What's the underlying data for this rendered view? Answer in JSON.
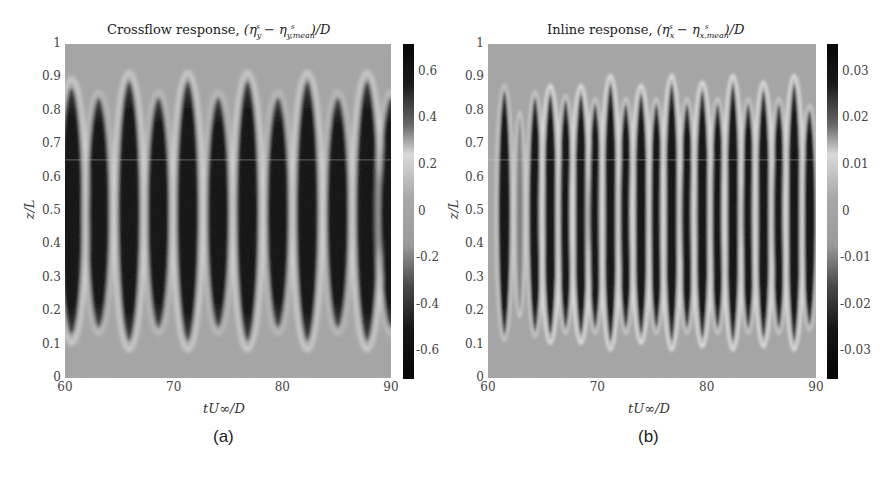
{
  "chart_data": [
    {
      "type": "heatmap",
      "panel": "(a)",
      "title": "Crossflow response, (η_y^s − η_{y,mean}^s)/D",
      "title_parts": {
        "text": "Crossflow response, ",
        "math": "(η",
        "sub1": "y",
        "sup1": "s",
        "minus": " − η",
        "sub2": "y,mean",
        "sup2": "s",
        "tail": ")/D"
      },
      "xlabel": "tU∞/D",
      "ylabel": "z/L",
      "xlim": [
        60,
        90
      ],
      "ylim": [
        0,
        1
      ],
      "xticks": [
        60,
        70,
        80,
        90
      ],
      "yticks": [
        0,
        0.1,
        0.2,
        0.3,
        0.4,
        0.5,
        0.6,
        0.7,
        0.8,
        0.9,
        1
      ],
      "colorbar": {
        "min": -0.72,
        "max": 0.72,
        "ticks": [
          0.6,
          0.4,
          0.2,
          0,
          -0.2,
          -0.4,
          -0.6
        ],
        "tick_labels": [
          "0.6",
          "0.4",
          "0.2",
          "0",
          "-0.2",
          "-0.4",
          "-0.6"
        ]
      },
      "colormap": "diverging gray (dark at extremes, light near +0.2)",
      "bands": [
        {
          "t": 60.6,
          "z_top": 0.87,
          "z_bottom": 0.13,
          "halo": true
        },
        {
          "t": 63.1,
          "z_top": 0.84,
          "z_bottom": 0.15,
          "halo": false
        },
        {
          "t": 65.9,
          "z_top": 0.89,
          "z_bottom": 0.11,
          "halo": true
        },
        {
          "t": 68.6,
          "z_top": 0.84,
          "z_bottom": 0.15,
          "halo": false
        },
        {
          "t": 71.3,
          "z_top": 0.89,
          "z_bottom": 0.11,
          "halo": true
        },
        {
          "t": 74.1,
          "z_top": 0.84,
          "z_bottom": 0.15,
          "halo": false
        },
        {
          "t": 76.8,
          "z_top": 0.89,
          "z_bottom": 0.11,
          "halo": true
        },
        {
          "t": 79.6,
          "z_top": 0.84,
          "z_bottom": 0.15,
          "halo": false
        },
        {
          "t": 82.3,
          "z_top": 0.89,
          "z_bottom": 0.11,
          "halo": true
        },
        {
          "t": 85.1,
          "z_top": 0.84,
          "z_bottom": 0.15,
          "halo": false
        },
        {
          "t": 87.8,
          "z_top": 0.89,
          "z_bottom": 0.11,
          "halo": true
        },
        {
          "t": 90.0,
          "z_top": 0.84,
          "z_bottom": 0.15,
          "halo": false
        }
      ],
      "band_half_width_t": 1.0
    },
    {
      "type": "heatmap",
      "panel": "(b)",
      "title": "Inline response, (η_x^s − η_{x,mean}^s)/D",
      "title_parts": {
        "text": "Inline response, ",
        "math": "(η",
        "sub1": "x",
        "sup1": "s",
        "minus": " − η",
        "sub2": "x,mean",
        "sup2": "s",
        "tail": ")/D"
      },
      "xlabel": "tU∞/D",
      "ylabel": "z/L",
      "xlim": [
        60,
        90
      ],
      "ylim": [
        0,
        1
      ],
      "xticks": [
        60,
        70,
        80,
        90
      ],
      "yticks": [
        0,
        0.1,
        0.2,
        0.3,
        0.4,
        0.5,
        0.6,
        0.7,
        0.8,
        0.9,
        1
      ],
      "colorbar": {
        "min": -0.036,
        "max": 0.036,
        "ticks": [
          0.03,
          0.02,
          0.01,
          0,
          -0.01,
          -0.02,
          -0.03
        ],
        "tick_labels": [
          "0.03",
          "0.02",
          "0.01",
          "0",
          "-0.01",
          "-0.02",
          "-0.03"
        ]
      },
      "colormap": "diverging gray (dark at extremes, light near +0.01)",
      "bands": [
        {
          "t": 61.5,
          "z_top": 0.86,
          "z_bottom": 0.13,
          "halo": false
        },
        {
          "t": 62.9,
          "z_top": 0.78,
          "z_bottom": 0.2,
          "halo": false,
          "weak": true
        },
        {
          "t": 64.3,
          "z_top": 0.84,
          "z_bottom": 0.14,
          "halo": false
        },
        {
          "t": 65.7,
          "z_top": 0.85,
          "z_bottom": 0.13,
          "halo": true
        },
        {
          "t": 67.1,
          "z_top": 0.83,
          "z_bottom": 0.15,
          "halo": false
        },
        {
          "t": 68.5,
          "z_top": 0.85,
          "z_bottom": 0.13,
          "halo": true
        },
        {
          "t": 69.8,
          "z_top": 0.82,
          "z_bottom": 0.15,
          "halo": false
        },
        {
          "t": 71.2,
          "z_top": 0.88,
          "z_bottom": 0.11,
          "halo": true
        },
        {
          "t": 72.6,
          "z_top": 0.82,
          "z_bottom": 0.15,
          "halo": false
        },
        {
          "t": 74.0,
          "z_top": 0.85,
          "z_bottom": 0.13,
          "halo": true
        },
        {
          "t": 75.4,
          "z_top": 0.82,
          "z_bottom": 0.15,
          "halo": false
        },
        {
          "t": 76.8,
          "z_top": 0.88,
          "z_bottom": 0.11,
          "halo": true
        },
        {
          "t": 78.2,
          "z_top": 0.82,
          "z_bottom": 0.15,
          "halo": false
        },
        {
          "t": 79.6,
          "z_top": 0.86,
          "z_bottom": 0.12,
          "halo": true
        },
        {
          "t": 81.0,
          "z_top": 0.82,
          "z_bottom": 0.15,
          "halo": false
        },
        {
          "t": 82.4,
          "z_top": 0.88,
          "z_bottom": 0.11,
          "halo": true
        },
        {
          "t": 83.8,
          "z_top": 0.82,
          "z_bottom": 0.15,
          "halo": false
        },
        {
          "t": 85.2,
          "z_top": 0.86,
          "z_bottom": 0.12,
          "halo": true
        },
        {
          "t": 86.6,
          "z_top": 0.82,
          "z_bottom": 0.15,
          "halo": false
        },
        {
          "t": 88.0,
          "z_top": 0.88,
          "z_bottom": 0.11,
          "halo": true
        },
        {
          "t": 89.4,
          "z_top": 0.8,
          "z_bottom": 0.16,
          "halo": false
        }
      ],
      "band_half_width_t": 0.5
    }
  ],
  "panels": [
    {
      "caption": "(a)",
      "xlabel": "tU∞/D",
      "ylabel": "z/L",
      "xtick_labels": [
        "60",
        "70",
        "80",
        "90"
      ],
      "ytick_labels": [
        "0",
        "0.1",
        "0.2",
        "0.3",
        "0.4",
        "0.5",
        "0.6",
        "0.7",
        "0.8",
        "0.9",
        "1"
      ],
      "cb_tick_labels": [
        "0.6",
        "0.4",
        "0.2",
        "0",
        "-0.2",
        "-0.4",
        "-0.6"
      ],
      "title_text": "Crossflow response,"
    },
    {
      "caption": "(b)",
      "xlabel": "tU∞/D",
      "ylabel": "z/L",
      "xtick_labels": [
        "60",
        "70",
        "80",
        "90"
      ],
      "ytick_labels": [
        "0",
        "0.1",
        "0.2",
        "0.3",
        "0.4",
        "0.5",
        "0.6",
        "0.7",
        "0.8",
        "0.9",
        "1"
      ],
      "cb_tick_labels": [
        "0.03",
        "0.02",
        "0.01",
        "0",
        "-0.01",
        "-0.02",
        "-0.03"
      ],
      "title_text": "Inline response,"
    }
  ],
  "colors": {
    "background_gray": "#a4a4a4",
    "dark": "#0c0c0c",
    "light_halo": "#e2e2e2"
  }
}
